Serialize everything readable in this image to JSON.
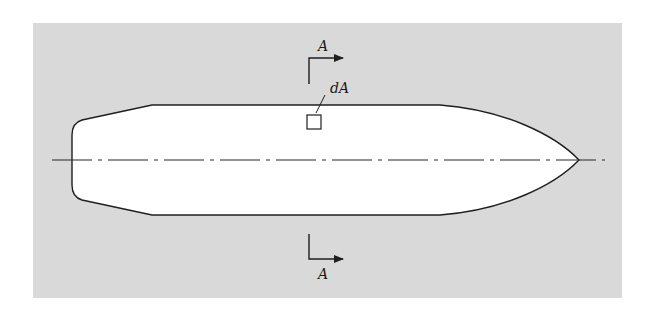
{
  "figure": {
    "background_color": "#d9d9d9",
    "hull_fill": "#ffffff",
    "stroke_color": "#1f1f1f"
  },
  "labels": {
    "section_top": "A",
    "section_bottom": "A",
    "area_element": "dA"
  },
  "icons": {
    "section_arrow_top": "section-cut-arrow-right",
    "section_arrow_bottom": "section-cut-arrow-right",
    "area_element_square": "small-square"
  }
}
